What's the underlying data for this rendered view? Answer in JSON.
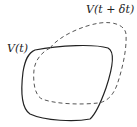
{
  "diagram": {
    "labels": {
      "volume_t": "V(t)",
      "volume_t_dt": "V(t + δt)"
    },
    "curves": [
      {
        "name": "V(t)",
        "style": "solid",
        "color": "#222222"
      },
      {
        "name": "V(t + δt)",
        "style": "dashed",
        "color": "#555555"
      }
    ]
  }
}
